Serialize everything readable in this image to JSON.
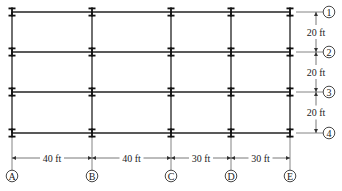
{
  "diagram": {
    "type": "structural-floor-framing-plan",
    "columns": [
      {
        "id": "A",
        "label": "A",
        "x": 12
      },
      {
        "id": "B",
        "label": "B",
        "x": 92
      },
      {
        "id": "C",
        "label": "C",
        "x": 171
      },
      {
        "id": "D",
        "label": "D",
        "x": 231
      },
      {
        "id": "E",
        "label": "E",
        "x": 290
      }
    ],
    "rows": [
      {
        "id": "1",
        "label": "1",
        "y": 12
      },
      {
        "id": "2",
        "label": "2",
        "y": 52
      },
      {
        "id": "3",
        "label": "3",
        "y": 92
      },
      {
        "id": "4",
        "label": "4",
        "y": 133
      }
    ],
    "horizontal_dimensions": [
      {
        "from": "A",
        "to": "B",
        "label": "40 ft"
      },
      {
        "from": "B",
        "to": "C",
        "label": "40 ft"
      },
      {
        "from": "C",
        "to": "D",
        "label": "30 ft"
      },
      {
        "from": "D",
        "to": "E",
        "label": "30 ft"
      }
    ],
    "vertical_dimensions": [
      {
        "from": "1",
        "to": "2",
        "label": "20 ft"
      },
      {
        "from": "2",
        "to": "3",
        "label": "20 ft"
      },
      {
        "from": "3",
        "to": "4",
        "label": "20 ft"
      }
    ],
    "column_symbol": "I-beam (wide flange)"
  }
}
